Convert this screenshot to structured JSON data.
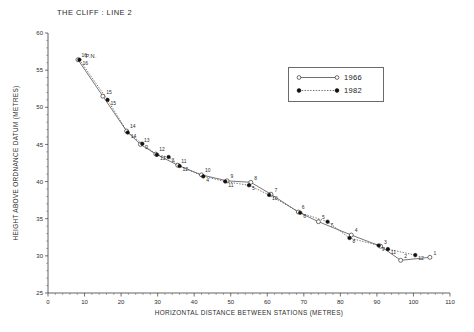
{
  "chart_data": {
    "type": "line",
    "title": "THE CLIFF : LINE 2",
    "xlabel": "HORIZONTAL DISTANCE BETWEEN STATIONS (METRES)",
    "ylabel": "HEIGHT ABOVE ORDNANCE DATUM (METRES)",
    "xlim": [
      0,
      110
    ],
    "ylim": [
      25,
      60
    ],
    "xticks": [
      0,
      10,
      20,
      30,
      40,
      50,
      60,
      70,
      80,
      90,
      100,
      110
    ],
    "yticks": [
      25,
      30,
      35,
      40,
      45,
      50,
      55,
      60
    ],
    "xtick_labels": [
      "0",
      "10",
      "20",
      "30",
      "40",
      "50",
      "60",
      "70",
      "80",
      "90",
      "100",
      "110"
    ],
    "ytick_labels": [
      "25",
      "30",
      "35",
      "40",
      "45",
      "50",
      "55",
      "60"
    ],
    "grid": false,
    "legend_position": "upper-right",
    "annotation_benchmark": "P.N.",
    "series": [
      {
        "name": "1966",
        "marker": "open-circle",
        "linestyle": "solid",
        "color": "#4a4a4a",
        "points": [
          {
            "label": "16",
            "x": 8.2,
            "y": 56.4
          },
          {
            "label": "15",
            "x": 15.0,
            "y": 51.5
          },
          {
            "label": "14",
            "x": 21.5,
            "y": 46.8
          },
          {
            "label": "13",
            "x": 25.3,
            "y": 45.0
          },
          {
            "label": "12",
            "x": 29.5,
            "y": 43.7
          },
          {
            "label": "11",
            "x": 35.5,
            "y": 42.2
          },
          {
            "label": "10",
            "x": 42.0,
            "y": 40.9
          },
          {
            "label": "9",
            "x": 49.0,
            "y": 40.1
          },
          {
            "label": "8",
            "x": 55.5,
            "y": 39.9
          },
          {
            "label": "7",
            "x": 61.0,
            "y": 38.3
          },
          {
            "label": "6",
            "x": 68.5,
            "y": 35.9
          },
          {
            "label": "5",
            "x": 74.0,
            "y": 34.6
          },
          {
            "label": "4",
            "x": 83.0,
            "y": 32.8
          },
          {
            "label": "3",
            "x": 91.0,
            "y": 31.3
          },
          {
            "label": "2",
            "x": 96.5,
            "y": 29.4
          },
          {
            "label": "1",
            "x": 104.5,
            "y": 29.8
          }
        ]
      },
      {
        "name": "1982",
        "marker": "filled-circle",
        "linestyle": "dotted",
        "color": "#111111",
        "points": [
          {
            "label": "16",
            "x": 8.6,
            "y": 56.4
          },
          {
            "label": "15",
            "x": 16.3,
            "y": 51.0
          },
          {
            "label": "14",
            "x": 21.8,
            "y": 46.6
          },
          {
            "label": "2",
            "x": 25.8,
            "y": 45.1
          },
          {
            "label": "13",
            "x": 29.8,
            "y": 43.6
          },
          {
            "label": "3",
            "x": 33.0,
            "y": 43.3
          },
          {
            "label": "12",
            "x": 36.0,
            "y": 42.1
          },
          {
            "label": "4",
            "x": 42.5,
            "y": 40.7
          },
          {
            "label": "11",
            "x": 48.5,
            "y": 40.0
          },
          {
            "label": "5",
            "x": 55.0,
            "y": 39.5
          },
          {
            "label": "10",
            "x": 60.5,
            "y": 38.2
          },
          {
            "label": "6",
            "x": 69.0,
            "y": 35.8
          },
          {
            "label": "7",
            "x": 76.5,
            "y": 34.6
          },
          {
            "label": "8",
            "x": 82.5,
            "y": 32.4
          },
          {
            "label": "9",
            "x": 90.5,
            "y": 31.4
          },
          {
            "label": "11b",
            "x": 93.0,
            "y": 30.9
          },
          {
            "label": "12b",
            "x": 100.5,
            "y": 30.1
          }
        ]
      }
    ]
  },
  "legend": {
    "entries": [
      {
        "label": "1966"
      },
      {
        "label": "1982"
      }
    ]
  }
}
